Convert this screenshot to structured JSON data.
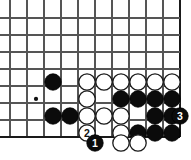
{
  "diagram": {
    "kind": "go-board-diagram",
    "board": {
      "origin_x": 10,
      "origin_y": 18,
      "spacing": 17,
      "cols": 11,
      "rows": 8,
      "line_color": "#555555",
      "edge_color": "#1a1a1a",
      "background_color": "#ffffff",
      "edges": {
        "right": true,
        "bottom": true
      },
      "star_points": [
        {
          "col": 1.53,
          "row": 4.76
        }
      ]
    },
    "stone_colors": {
      "black": "#0b0b0b",
      "white": "#ffffff",
      "outline": "#1a1a1a"
    },
    "stone_radius": 8.2,
    "stones": [
      {
        "id": "b1",
        "color": "black",
        "x": 53,
        "y": 82,
        "label": ""
      },
      {
        "id": "b2",
        "color": "black",
        "x": 53,
        "y": 116,
        "label": ""
      },
      {
        "id": "b3",
        "color": "black",
        "x": 70,
        "y": 116,
        "label": ""
      },
      {
        "id": "w1",
        "color": "white",
        "x": 87,
        "y": 82,
        "label": ""
      },
      {
        "id": "w2",
        "color": "white",
        "x": 104,
        "y": 82,
        "label": ""
      },
      {
        "id": "w3",
        "color": "white",
        "x": 121,
        "y": 82,
        "label": ""
      },
      {
        "id": "w4",
        "color": "white",
        "x": 138,
        "y": 82,
        "label": ""
      },
      {
        "id": "w5",
        "color": "white",
        "x": 155,
        "y": 82,
        "label": ""
      },
      {
        "id": "w6",
        "color": "white",
        "x": 172,
        "y": 82,
        "label": ""
      },
      {
        "id": "w7",
        "color": "white",
        "x": 87,
        "y": 99,
        "label": ""
      },
      {
        "id": "b4",
        "color": "black",
        "x": 121,
        "y": 99,
        "label": ""
      },
      {
        "id": "b5",
        "color": "black",
        "x": 138,
        "y": 99,
        "label": ""
      },
      {
        "id": "b6",
        "color": "black",
        "x": 155,
        "y": 99,
        "label": ""
      },
      {
        "id": "b7",
        "color": "black",
        "x": 172,
        "y": 99,
        "label": ""
      },
      {
        "id": "w8",
        "color": "white",
        "x": 87,
        "y": 116,
        "label": ""
      },
      {
        "id": "w9",
        "color": "white",
        "x": 104,
        "y": 116,
        "label": ""
      },
      {
        "id": "w10",
        "color": "white",
        "x": 121,
        "y": 116,
        "label": ""
      },
      {
        "id": "b8",
        "color": "black",
        "x": 155,
        "y": 116,
        "label": ""
      },
      {
        "id": "b9",
        "color": "black",
        "x": 172,
        "y": 116,
        "label": ""
      },
      {
        "id": "m3",
        "color": "black",
        "x": 180,
        "y": 116,
        "label": "3"
      },
      {
        "id": "m2",
        "color": "white",
        "x": 87,
        "y": 133,
        "label": "2"
      },
      {
        "id": "w11",
        "color": "white",
        "x": 121,
        "y": 133,
        "label": ""
      },
      {
        "id": "b10",
        "color": "black",
        "x": 138,
        "y": 133,
        "label": ""
      },
      {
        "id": "b11",
        "color": "black",
        "x": 155,
        "y": 133,
        "label": ""
      },
      {
        "id": "b12",
        "color": "black",
        "x": 172,
        "y": 133,
        "label": ""
      },
      {
        "id": "m1",
        "color": "black",
        "x": 95,
        "y": 143,
        "label": "1"
      },
      {
        "id": "w12",
        "color": "white",
        "x": 121,
        "y": 143,
        "label": ""
      },
      {
        "id": "w13",
        "color": "white",
        "x": 138,
        "y": 143,
        "label": ""
      }
    ],
    "move_sequence": [
      {
        "number": "1",
        "color": "black"
      },
      {
        "number": "2",
        "color": "white"
      },
      {
        "number": "3",
        "color": "black"
      }
    ]
  }
}
